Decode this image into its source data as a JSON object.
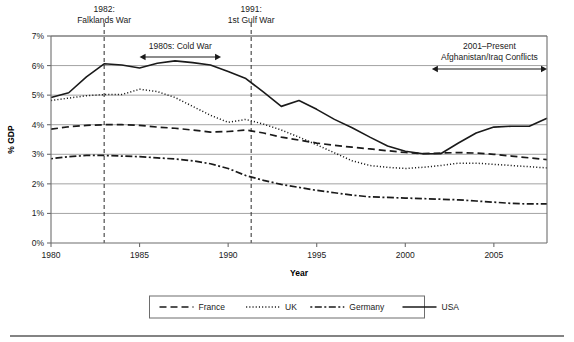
{
  "chart_data": {
    "type": "line",
    "title": "",
    "xlabel": "Year",
    "ylabel": "% GDP",
    "xlim": [
      1980,
      2008
    ],
    "ylim": [
      0,
      7
    ],
    "grid": true,
    "legend_position": "bottom",
    "x_ticks": [
      "1980",
      "1985",
      "1990",
      "1995",
      "2000",
      "2005"
    ],
    "x_tick_values": [
      1980,
      1985,
      1990,
      1995,
      2000,
      2005
    ],
    "y_ticks": [
      "0%",
      "1%",
      "2%",
      "3%",
      "4%",
      "5%",
      "6%",
      "7%"
    ],
    "y_tick_values": [
      0,
      1,
      2,
      3,
      4,
      5,
      6,
      7
    ],
    "x": [
      1980,
      1981,
      1982,
      1983,
      1984,
      1985,
      1986,
      1987,
      1988,
      1989,
      1990,
      1991,
      1992,
      1993,
      1994,
      1995,
      1996,
      1997,
      1998,
      1999,
      2000,
      2001,
      2002,
      2003,
      2004,
      2005,
      2006,
      2007,
      2008
    ],
    "series": [
      {
        "name": "France",
        "style": "dashed",
        "color": "#1a1a1a",
        "values": [
          3.85,
          3.93,
          3.98,
          4.0,
          4.0,
          3.98,
          3.92,
          3.88,
          3.82,
          3.75,
          3.77,
          3.82,
          3.72,
          3.58,
          3.48,
          3.38,
          3.3,
          3.24,
          3.18,
          3.12,
          3.06,
          3.02,
          3.04,
          3.06,
          3.04,
          3.0,
          2.94,
          2.88,
          2.82
        ]
      },
      {
        "name": "UK",
        "style": "dotted",
        "color": "#1a1a1a",
        "values": [
          4.82,
          4.9,
          4.98,
          5.02,
          5.02,
          5.2,
          5.12,
          4.92,
          4.62,
          4.32,
          4.08,
          4.18,
          4.02,
          3.82,
          3.58,
          3.32,
          3.05,
          2.78,
          2.62,
          2.56,
          2.52,
          2.56,
          2.62,
          2.7,
          2.7,
          2.66,
          2.62,
          2.58,
          2.54
        ]
      },
      {
        "name": "Germany",
        "style": "dashdot",
        "color": "#1a1a1a",
        "values": [
          2.85,
          2.92,
          2.96,
          2.96,
          2.94,
          2.92,
          2.88,
          2.84,
          2.78,
          2.68,
          2.52,
          2.28,
          2.12,
          1.98,
          1.88,
          1.78,
          1.7,
          1.62,
          1.56,
          1.54,
          1.52,
          1.5,
          1.48,
          1.46,
          1.42,
          1.38,
          1.34,
          1.32,
          1.32
        ]
      },
      {
        "name": "USA",
        "style": "solid",
        "color": "#1a1a1a",
        "values": [
          4.92,
          5.08,
          5.62,
          6.06,
          6.02,
          5.92,
          6.08,
          6.16,
          6.1,
          6.02,
          5.8,
          5.56,
          5.1,
          4.62,
          4.82,
          4.52,
          4.18,
          3.9,
          3.58,
          3.28,
          3.1,
          3.02,
          3.02,
          3.38,
          3.72,
          3.92,
          3.95,
          3.95,
          4.22
        ]
      }
    ],
    "annotations": [
      {
        "id": "falklands",
        "year": 1983,
        "title": "1982:",
        "subtitle": "Falklands War",
        "type": "event-line"
      },
      {
        "id": "gulf-war",
        "year": 1991.3,
        "title": "1991:",
        "subtitle": "1st Gulf War",
        "type": "event-line"
      },
      {
        "id": "cold-war",
        "label": "1980s: Cold War",
        "start_year": 1985,
        "end_year": 1989.6,
        "type": "span-arrow"
      },
      {
        "id": "afghanistan-iraq",
        "title": "2001–Present",
        "subtitle": "Afghanistan/Iraq Conflicts",
        "start_year": 2001.5,
        "end_year": 2008,
        "type": "span-arrow"
      }
    ]
  }
}
